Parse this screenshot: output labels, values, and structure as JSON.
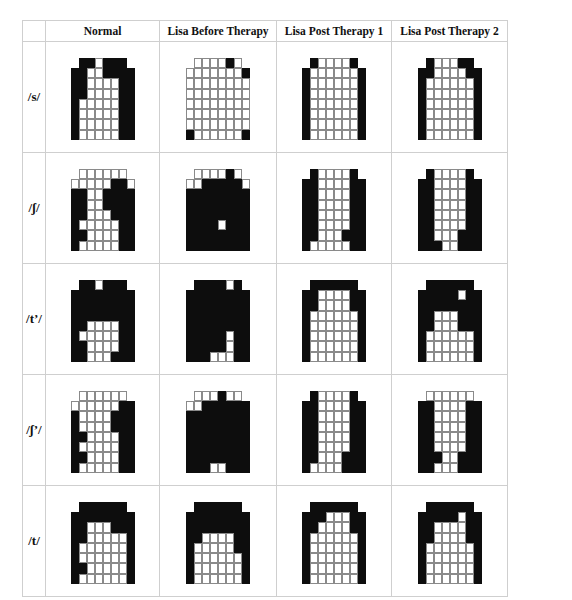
{
  "table": {
    "column_headers": [
      "Normal",
      "Lisa Before Therapy",
      "Lisa Post Therapy 1",
      "Lisa Post Therapy 2"
    ],
    "legend": {
      "on_color": "#0d0d0d",
      "off_color": "#ffffff",
      "on_meaning": "tongue-palate contact",
      "encoding": "8 rows x 8 cols, '1' = black cell, '0' = white cell, '-' = no electrode"
    },
    "rows": [
      {
        "label": "/s/",
        "grids": [
          [
            "-110111-",
            "11001111",
            "11000011",
            "11000011",
            "10000011",
            "10000011",
            "10000011",
            "10000011"
          ],
          [
            "-000010-",
            "00000001",
            "00000000",
            "00000000",
            "00000000",
            "00000000",
            "00000000",
            "10000001"
          ],
          [
            "-100001-",
            "10000001",
            "10000001",
            "10000001",
            "10000001",
            "10000001",
            "10000001",
            "10000001"
          ],
          [
            "-100011-",
            "11000011",
            "10000001",
            "10000001",
            "10000001",
            "10000001",
            "10000001",
            "10000001"
          ]
        ]
      },
      {
        "label": "/ʃ/",
        "grids": [
          [
            "-000000-",
            "00000110",
            "11001111",
            "11001111",
            "11000111",
            "10000011",
            "11000011",
            "10000011"
          ],
          [
            "-000010-",
            "00111110",
            "11111111",
            "11111111",
            "11111111",
            "11110111",
            "11111111",
            "11111111"
          ],
          [
            "-100001-",
            "11000011",
            "11000011",
            "11000011",
            "11000011",
            "11000011",
            "11000111",
            "10000011"
          ],
          [
            "-100001-",
            "11000011",
            "11000011",
            "11000011",
            "11000011",
            "11000011",
            "11000111",
            "11100111"
          ]
        ]
      },
      {
        "label": "/tʼ/",
        "grids": [
          [
            "-110111-",
            "11111111",
            "11111111",
            "11111111",
            "11000011",
            "10000011",
            "11000011",
            "11000111"
          ],
          [
            "-111101-",
            "11111111",
            "11111111",
            "11111111",
            "11111111",
            "11111011",
            "11111011",
            "11100011"
          ],
          [
            "-111111-",
            "11000011",
            "11000011",
            "10000001",
            "10000001",
            "10000001",
            "10000001",
            "10000001"
          ],
          [
            "-111111-",
            "11111011",
            "11111111",
            "11000111",
            "11000111",
            "10000001",
            "10000001",
            "10000001"
          ]
        ]
      },
      {
        "label": "/ʃʼ/",
        "grids": [
          [
            "-000000-",
            "00000011",
            "10000111",
            "10000111",
            "11000011",
            "10000011",
            "11000011",
            "10000011"
          ],
          [
            "-000100-",
            "00111111",
            "11111111",
            "11111111",
            "11111111",
            "11111111",
            "11111111",
            "11100111"
          ],
          [
            "-100001-",
            "11000011",
            "11000011",
            "11000011",
            "11000011",
            "11000011",
            "11000111",
            "10000111"
          ],
          [
            "-000000-",
            "11000011",
            "11000011",
            "11000011",
            "11000011",
            "11000011",
            "11100111",
            "11000111"
          ]
        ]
      },
      {
        "label": "/t/",
        "grids": [
          [
            "-111111-",
            "11111111",
            "11000111",
            "11000001",
            "10000001",
            "10000001",
            "11000001",
            "10000001"
          ],
          [
            "-111111-",
            "11111111",
            "11111111",
            "11000011",
            "10000011",
            "10000001",
            "10000001",
            "10000001"
          ],
          [
            "-111111-",
            "11100011",
            "11000011",
            "10000001",
            "10000001",
            "10000001",
            "10000001",
            "10000001"
          ],
          [
            "-111111-",
            "11111011",
            "11000011",
            "11000011",
            "10000001",
            "10000001",
            "10000001",
            "10000001"
          ]
        ]
      }
    ]
  }
}
